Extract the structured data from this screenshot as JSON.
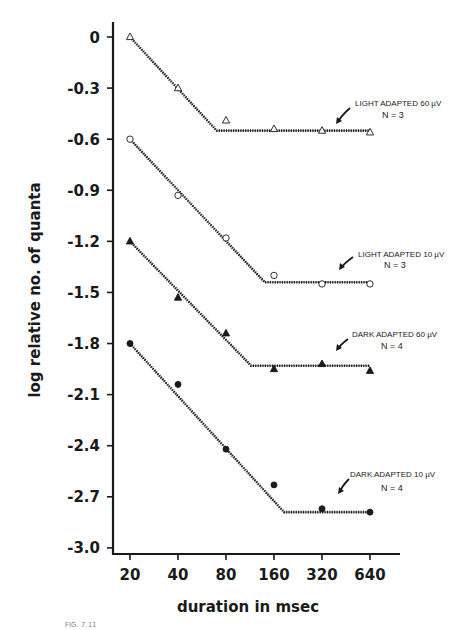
{
  "chart_data": {
    "type": "line",
    "title": "",
    "xlabel": "duration in msec",
    "ylabel": "log relative no. of quanta",
    "x_scale": "log2",
    "categories": [
      "20",
      "40",
      "80",
      "160",
      "320",
      "640"
    ],
    "x": [
      20,
      40,
      80,
      160,
      320,
      640
    ],
    "yticks": [
      "0",
      "-0.3",
      "-0.6",
      "-0.9",
      "-1.2",
      "-1.5",
      "-1.8",
      "-2.1",
      "-2.4",
      "-2.7",
      "-3.0"
    ],
    "ylim": [
      -3.0,
      0
    ],
    "grid": false,
    "legend": "inline annotations with arrows at right of each curve",
    "series": [
      {
        "name": "LIGHT ADAPTED 60 µV",
        "n_label": "N = 3",
        "marker": "open-triangle",
        "values": [
          0,
          -0.3,
          -0.49,
          -0.54,
          -0.55,
          -0.56
        ],
        "fit": {
          "slope_segment": [
            [
              20,
              0
            ],
            [
              70,
              -0.55
            ]
          ],
          "plateau": [
            [
              70,
              -0.55
            ],
            [
              640,
              -0.55
            ]
          ]
        }
      },
      {
        "name": "LIGHT ADAPTED 10 µV",
        "n_label": "N = 3",
        "marker": "open-circle",
        "values": [
          -0.6,
          -0.93,
          -1.18,
          -1.4,
          -1.45,
          -1.45
        ],
        "fit": {
          "slope_segment": [
            [
              20,
              -0.6
            ],
            [
              140,
              -1.44
            ]
          ],
          "plateau": [
            [
              140,
              -1.44
            ],
            [
              640,
              -1.44
            ]
          ]
        }
      },
      {
        "name": "DARK ADAPTED 60 µV",
        "n_label": "N = 4",
        "marker": "filled-triangle",
        "values": [
          -1.2,
          -1.53,
          -1.74,
          -1.95,
          -1.92,
          -1.96
        ],
        "fit": {
          "slope_segment": [
            [
              20,
              -1.2
            ],
            [
              115,
              -1.93
            ]
          ],
          "plateau": [
            [
              115,
              -1.93
            ],
            [
              640,
              -1.93
            ]
          ]
        }
      },
      {
        "name": "DARK ADAPTED 10 µV",
        "n_label": "N = 4",
        "marker": "filled-circle",
        "values": [
          -1.8,
          -2.04,
          -2.42,
          -2.63,
          -2.77,
          -2.79
        ],
        "fit": {
          "slope_segment": [
            [
              20,
              -1.8
            ],
            [
              185,
              -2.79
            ]
          ],
          "plateau": [
            [
              185,
              -2.79
            ],
            [
              640,
              -2.79
            ]
          ]
        }
      }
    ]
  },
  "annotations": [
    {
      "label": "LIGHT ADAPTED  60 µV",
      "n": "N = 3"
    },
    {
      "label": "LIGHT ADAPTED  10 µV",
      "n": "N = 3"
    },
    {
      "label": "DARK ADAPTED  60 µV",
      "n": "N = 4"
    },
    {
      "label": "DARK ADAPTED  10 µV",
      "n": "N = 4"
    }
  ],
  "axes": {
    "xlabel": "duration in msec",
    "ylabel": "log relative no. of quanta"
  },
  "caption": "FIG. 7.11"
}
